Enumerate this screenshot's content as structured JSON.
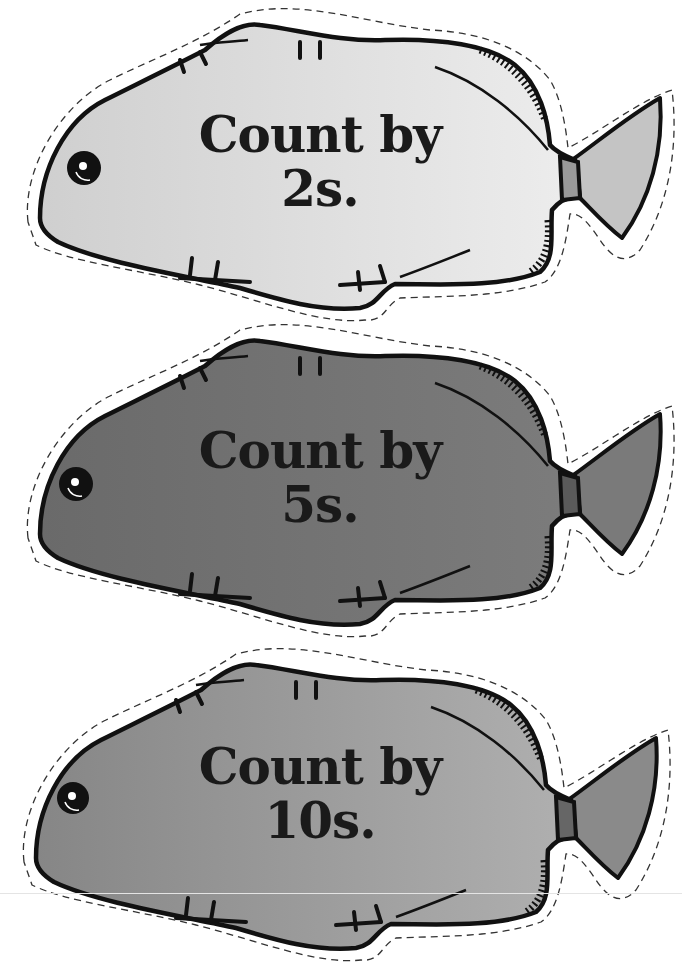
{
  "worksheet": {
    "fish": [
      {
        "line1": "Count by",
        "line2": "2s.",
        "body_color_left": "#cfcfcf",
        "body_color_right": "#ededed",
        "tail_color": "#c4c4c4",
        "peduncle_color": "#9a9a9a",
        "top": 0
      },
      {
        "line1": "Count by",
        "line2": "5s.",
        "body_color_left": "#6a6a6a",
        "body_color_right": "#7c7c7c",
        "tail_color": "#7a7a7a",
        "peduncle_color": "#5a5a5a",
        "top": 316
      },
      {
        "line1": "Count by",
        "line2": "10s.",
        "body_color_left": "#868686",
        "body_color_right": "#b0b0b0",
        "tail_color": "#8a8a8a",
        "peduncle_color": "#666666",
        "top": 632
      }
    ],
    "outline_color": "#111111",
    "cut_line_color": "#333333"
  }
}
